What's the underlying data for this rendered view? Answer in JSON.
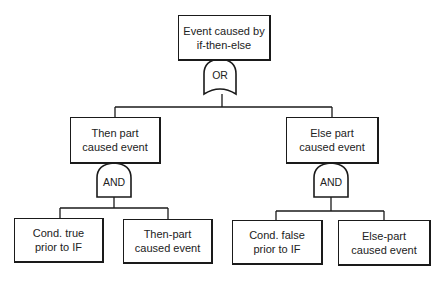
{
  "diagram": {
    "type": "fault-tree",
    "colors": {
      "line": "#1a1a1a",
      "text": "#222222",
      "background": "#ffffff"
    },
    "top_event": {
      "line1": "Event caused by",
      "line2": "if-then-else"
    },
    "top_gate": {
      "label": "OR"
    },
    "left_branch": {
      "event": {
        "line1": "Then part",
        "line2": "caused event"
      },
      "gate": {
        "label": "AND"
      },
      "children": [
        {
          "line1": "Cond. true",
          "line2": "prior to IF"
        },
        {
          "line1": "Then-part",
          "line2": "caused event"
        }
      ]
    },
    "right_branch": {
      "event": {
        "line1": "Else part",
        "line2": "caused event"
      },
      "gate": {
        "label": "AND"
      },
      "children": [
        {
          "line1": "Cond. false",
          "line2": "prior to IF"
        },
        {
          "line1": "Else-part",
          "line2": "caused event"
        }
      ]
    }
  }
}
